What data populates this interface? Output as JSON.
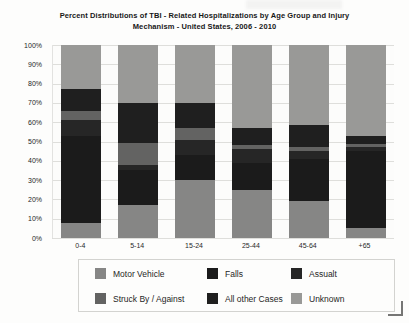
{
  "title": "Percent Distributions of TBI - Related Hospitalizations by Age Group and Injury Mechanism - United States, 2006 - 2010",
  "chart_data": {
    "type": "bar",
    "stacked": true,
    "title": "Percent Distributions of TBI - Related Hospitalizations by Age Group and Injury Mechanism - United States, 2006 - 2010",
    "categories": [
      "0-4",
      "5-14",
      "15-24",
      "25-44",
      "45-64",
      "+65"
    ],
    "series": [
      {
        "name": "Motor Vehicle",
        "color": "#868685",
        "values": [
          8,
          17,
          30,
          25,
          19,
          5
        ]
      },
      {
        "name": "Falls",
        "color": "#1b1b1b",
        "values": [
          45,
          18,
          13,
          14,
          22,
          40
        ]
      },
      {
        "name": "Assualt",
        "color": "#262626",
        "values": [
          8,
          3,
          8,
          7,
          4,
          2
        ]
      },
      {
        "name": "Struck By / Against",
        "color": "#636362",
        "values": [
          5,
          11,
          6,
          2,
          2,
          1.5
        ]
      },
      {
        "name": "All other Cases",
        "color": "#1f1f1f",
        "values": [
          11,
          21,
          13,
          9,
          11.5,
          4.5
        ]
      },
      {
        "name": "Unknown",
        "color": "#999997",
        "values": [
          23,
          30,
          30,
          43,
          41.5,
          47
        ]
      }
    ],
    "y_ticks": [
      "100%",
      "90%",
      "80%",
      "70%",
      "60%",
      "50%",
      "40%",
      "30%",
      "20%",
      "10%",
      "0%"
    ],
    "ylim": [
      0,
      100
    ],
    "xlabel": "",
    "ylabel": "",
    "grid": true,
    "legend_position": "bottom"
  }
}
